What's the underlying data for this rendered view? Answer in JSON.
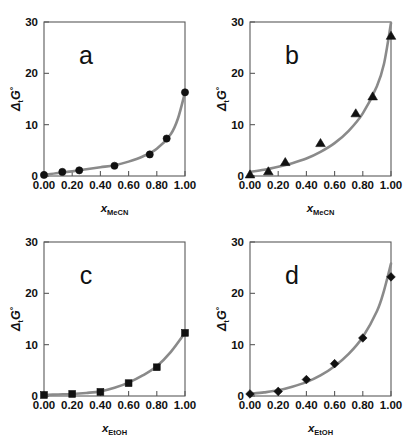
{
  "figure": {
    "panel_count": 4,
    "curve_color": "#8a8a8a",
    "marker_color": "#111111",
    "axis_color": "#5a5a5a",
    "background_color": "#ffffff"
  },
  "axis": {
    "y_label_delta": "Δ",
    "y_label_sub": "t",
    "y_label_g": "G",
    "y_label_deg": "°",
    "y_ticks": [
      "0",
      "10",
      "20",
      "30"
    ],
    "y_tick_values": [
      0,
      10,
      20,
      30
    ],
    "x_ticks": [
      "0.00",
      "0.20",
      "0.40",
      "0.60",
      "0.80",
      "1.00"
    ],
    "x_tick_values": [
      0.0,
      0.2,
      0.4,
      0.6,
      0.8,
      1.0
    ],
    "x_label_symbol": "x",
    "x_label_mecn": "MeCN",
    "x_label_etoh": "EtOH"
  },
  "chart_data": [
    {
      "type": "scatter",
      "panel": "a",
      "title": "a",
      "xlabel": "x_MeCN",
      "ylabel": "ΔtG°",
      "xlim": [
        0.0,
        1.0
      ],
      "ylim": [
        0,
        30
      ],
      "grid": false,
      "legend": "none",
      "marker": "circle",
      "x": [
        0.0,
        0.13,
        0.25,
        0.5,
        0.75,
        0.87,
        1.0
      ],
      "y": [
        0.2,
        0.8,
        1.1,
        2.0,
        4.2,
        7.3,
        16.3
      ],
      "fit_x": [
        0.0,
        0.1,
        0.2,
        0.3,
        0.4,
        0.5,
        0.6,
        0.7,
        0.8,
        0.9,
        0.95,
        1.0
      ],
      "fit_y": [
        0.2,
        0.6,
        0.9,
        1.3,
        1.7,
        2.1,
        2.8,
        3.8,
        5.3,
        8.2,
        11.2,
        16.3
      ]
    },
    {
      "type": "scatter",
      "panel": "b",
      "title": "b",
      "xlabel": "x_MeCN",
      "ylabel": "ΔtG°",
      "xlim": [
        0.0,
        1.0
      ],
      "ylim": [
        0,
        30
      ],
      "grid": false,
      "legend": "none",
      "marker": "triangle",
      "x": [
        0.0,
        0.13,
        0.25,
        0.5,
        0.75,
        0.87,
        1.0
      ],
      "y": [
        0.3,
        0.9,
        2.7,
        6.4,
        12.2,
        15.5,
        27.3
      ],
      "fit_x": [
        0.0,
        0.1,
        0.2,
        0.3,
        0.4,
        0.5,
        0.6,
        0.7,
        0.8,
        0.9,
        0.95,
        1.0
      ],
      "fit_y": [
        0.8,
        1.2,
        1.8,
        2.5,
        3.4,
        4.7,
        6.4,
        8.8,
        12.2,
        17.5,
        21.8,
        29.8
      ]
    },
    {
      "type": "scatter",
      "panel": "c",
      "title": "c",
      "xlabel": "x_EtOH",
      "ylabel": "ΔtG°",
      "xlim": [
        0.0,
        1.0
      ],
      "ylim": [
        0,
        30
      ],
      "grid": false,
      "legend": "none",
      "marker": "square",
      "x": [
        0.0,
        0.2,
        0.4,
        0.6,
        0.8,
        1.0
      ],
      "y": [
        0.2,
        0.4,
        0.8,
        2.5,
        5.6,
        12.3
      ],
      "fit_x": [
        0.0,
        0.1,
        0.2,
        0.3,
        0.4,
        0.5,
        0.6,
        0.7,
        0.8,
        0.9,
        1.0
      ],
      "fit_y": [
        0.2,
        0.3,
        0.4,
        0.6,
        0.9,
        1.6,
        2.6,
        4.0,
        5.8,
        8.6,
        12.3
      ]
    },
    {
      "type": "scatter",
      "panel": "d",
      "title": "d",
      "xlabel": "x_EtOH",
      "ylabel": "ΔtG°",
      "xlim": [
        0.0,
        1.0
      ],
      "ylim": [
        0,
        30
      ],
      "grid": false,
      "legend": "none",
      "marker": "diamond",
      "x": [
        0.0,
        0.2,
        0.4,
        0.6,
        0.8,
        1.0
      ],
      "y": [
        0.4,
        0.9,
        3.2,
        6.3,
        11.3,
        23.2
      ],
      "fit_x": [
        0.0,
        0.1,
        0.2,
        0.3,
        0.4,
        0.5,
        0.6,
        0.7,
        0.8,
        0.9,
        0.95,
        1.0
      ],
      "fit_y": [
        0.4,
        0.7,
        1.1,
        1.8,
        2.7,
        4.0,
        5.8,
        8.2,
        11.5,
        16.5,
        20.5,
        25.8
      ]
    }
  ]
}
